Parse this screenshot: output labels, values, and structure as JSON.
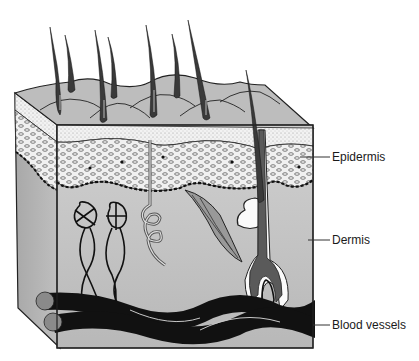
{
  "diagram": {
    "labels": [
      {
        "id": "epidermis",
        "text": "Epidermis",
        "x": 332,
        "y": 150,
        "line_y": 157
      },
      {
        "id": "dermis",
        "text": "Dermis",
        "x": 332,
        "y": 233,
        "line_y": 240
      },
      {
        "id": "blood-vessels",
        "text": "Blood vessels",
        "x": 332,
        "y": 318,
        "line_y": 325
      }
    ],
    "colors": {
      "skin_surface": "#bdbdbd",
      "dermis": "#c4c4c4",
      "dermis_side": "#b0b0b0",
      "epidermis_layer": "#ececec",
      "hair": "#3a3a3a",
      "vessel": "#111111",
      "vessel_end": "#8a8a8a",
      "outline": "#222222"
    }
  }
}
